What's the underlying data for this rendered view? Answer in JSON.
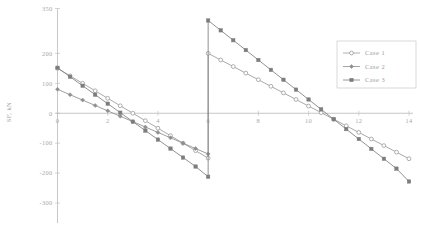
{
  "chart_data": {
    "type": "line",
    "title": "",
    "subtitle": "",
    "xlabel": "",
    "ylabel": "SF, kN",
    "xlim": [
      0,
      14
    ],
    "ylim": [
      -350,
      350
    ],
    "xticks": [
      0,
      2,
      4,
      6,
      8,
      10,
      12,
      14
    ],
    "xtick_labels": [
      "0",
      "2",
      "4",
      "6",
      "8",
      "10",
      "12",
      "14"
    ],
    "yticks": [
      -300,
      -200,
      -100,
      0,
      100,
      200,
      350
    ],
    "ytick_labels": [
      "-300",
      "-200",
      "-100",
      "0",
      "100",
      "200",
      "350"
    ],
    "grid": false,
    "legend_position": "upper-right",
    "discontinuity_x": 6,
    "series": [
      {
        "name": "Case 1",
        "marker": "open-circle",
        "color": "#9a9a9a",
        "points_left": [
          {
            "x": 0,
            "y": 150
          },
          {
            "x": 0.5,
            "y": 125
          },
          {
            "x": 1,
            "y": 100
          },
          {
            "x": 1.5,
            "y": 75
          },
          {
            "x": 2,
            "y": 50
          },
          {
            "x": 2.5,
            "y": 25
          },
          {
            "x": 3,
            "y": 0
          },
          {
            "x": 3.5,
            "y": -25
          },
          {
            "x": 4,
            "y": -50
          },
          {
            "x": 4.5,
            "y": -75
          },
          {
            "x": 5,
            "y": -100
          },
          {
            "x": 5.5,
            "y": -125
          },
          {
            "x": 6,
            "y": -150
          }
        ],
        "points_right": [
          {
            "x": 6,
            "y": 200
          },
          {
            "x": 6.5,
            "y": 178
          },
          {
            "x": 7,
            "y": 156
          },
          {
            "x": 7.5,
            "y": 134
          },
          {
            "x": 8,
            "y": 112
          },
          {
            "x": 8.5,
            "y": 90
          },
          {
            "x": 9,
            "y": 68
          },
          {
            "x": 9.5,
            "y": 46
          },
          {
            "x": 10,
            "y": 24
          },
          {
            "x": 10.5,
            "y": 2
          },
          {
            "x": 11,
            "y": -20
          },
          {
            "x": 11.5,
            "y": -42
          },
          {
            "x": 12,
            "y": -64
          },
          {
            "x": 12.5,
            "y": -86
          },
          {
            "x": 13,
            "y": -108
          },
          {
            "x": 13.5,
            "y": -130
          },
          {
            "x": 14,
            "y": -152
          }
        ]
      },
      {
        "name": "Case 2",
        "marker": "filled-diamond",
        "color": "#8e8e8e",
        "points_left": [
          {
            "x": 0,
            "y": 80
          },
          {
            "x": 0.5,
            "y": 62
          },
          {
            "x": 1,
            "y": 44
          },
          {
            "x": 1.5,
            "y": 26
          },
          {
            "x": 2,
            "y": 8
          },
          {
            "x": 2.5,
            "y": -10
          },
          {
            "x": 3,
            "y": -28
          },
          {
            "x": 3.5,
            "y": -46
          },
          {
            "x": 4,
            "y": -64
          },
          {
            "x": 4.5,
            "y": -82
          },
          {
            "x": 5,
            "y": -100
          },
          {
            "x": 5.5,
            "y": -118
          },
          {
            "x": 6,
            "y": -136
          }
        ],
        "points_right": []
      },
      {
        "name": "Case 3",
        "marker": "filled-square",
        "color": "#7d7d7d",
        "points_left": [
          {
            "x": 0,
            "y": 152
          },
          {
            "x": 0.5,
            "y": 122
          },
          {
            "x": 1,
            "y": 92
          },
          {
            "x": 1.5,
            "y": 62
          },
          {
            "x": 2,
            "y": 32
          },
          {
            "x": 2.5,
            "y": 2
          },
          {
            "x": 3,
            "y": -28
          },
          {
            "x": 3.5,
            "y": -58
          },
          {
            "x": 4,
            "y": -88
          },
          {
            "x": 4.5,
            "y": -118
          },
          {
            "x": 5,
            "y": -148
          },
          {
            "x": 5.5,
            "y": -178
          },
          {
            "x": 6,
            "y": -212
          }
        ],
        "points_right": [
          {
            "x": 6,
            "y": 310
          },
          {
            "x": 6.5,
            "y": 277
          },
          {
            "x": 7,
            "y": 244
          },
          {
            "x": 7.5,
            "y": 211
          },
          {
            "x": 8,
            "y": 178
          },
          {
            "x": 8.5,
            "y": 145
          },
          {
            "x": 9,
            "y": 112
          },
          {
            "x": 9.5,
            "y": 79
          },
          {
            "x": 10,
            "y": 46
          },
          {
            "x": 10.5,
            "y": 13
          },
          {
            "x": 11,
            "y": -20
          },
          {
            "x": 11.5,
            "y": -53
          },
          {
            "x": 12,
            "y": -86
          },
          {
            "x": 12.5,
            "y": -119
          },
          {
            "x": 13,
            "y": -152
          },
          {
            "x": 13.5,
            "y": -185
          },
          {
            "x": 14,
            "y": -228
          }
        ]
      }
    ]
  },
  "legend": {
    "entries": [
      {
        "label": "Case 1"
      },
      {
        "label": "Case 2"
      },
      {
        "label": "Case 3"
      }
    ]
  },
  "axes": {
    "y_title": "SF, kN"
  }
}
